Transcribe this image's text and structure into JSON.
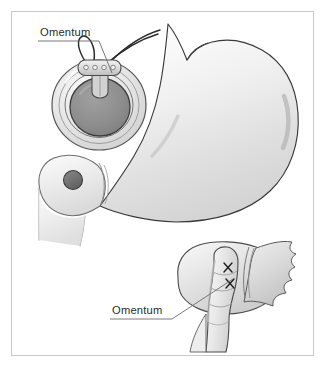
{
  "figure": {
    "background_color": "#ffffff",
    "border_color": "#c9c9c9",
    "ink_color": "#2b2b2b"
  },
  "labels": [
    {
      "id": "omentum-top",
      "text": "Omentum",
      "x": 40,
      "y": 36,
      "underline": {
        "x1": 38,
        "y1": 41,
        "x2": 99,
        "y2": 41
      },
      "leader": {
        "x1": 99,
        "y1": 41,
        "x2": 112,
        "y2": 73
      }
    },
    {
      "id": "omentum-bottom",
      "text": "Omentum",
      "x": 112,
      "y": 314,
      "underline": {
        "x1": 110,
        "y1": 319,
        "x2": 172,
        "y2": 319
      },
      "leader": {
        "x1": 172,
        "y1": 319,
        "x2": 232,
        "y2": 280
      }
    }
  ],
  "anatomy": {
    "stomach": {
      "name": "stomach-body",
      "fill_top": "#fdfdfd",
      "fill_bottom": "#d6d6d6",
      "outline": "#3a3a3a"
    },
    "duodenum": {
      "name": "duodenal-limb",
      "fill_top": "#fbfbfb",
      "fill_bottom": "#dcdcdc",
      "outline": "#6e6e6e"
    },
    "port_site": {
      "name": "access-port",
      "fill": "#6f6f6f",
      "outline": "#3c3c3c",
      "cx": 73,
      "cy": 180,
      "r": 9
    }
  },
  "device": {
    "band": {
      "name": "gastric-band-ring",
      "cx": 99,
      "cy": 105,
      "outer_rx": 47,
      "outer_ry": 45,
      "ring_fill": "#e8e8e8",
      "ring_outline": "#55555a",
      "lumen_fill": "#8e8e8e",
      "lumen_outline": "#3d3d3d",
      "lumen_rx": 30,
      "lumen_ry": 29
    },
    "buckle": {
      "name": "band-buckle",
      "cx": 99,
      "cy": 68,
      "width": 40,
      "height": 15,
      "fill": "#dcdcdc",
      "outline": "#4a4a4a",
      "stud_count": 4
    },
    "tubing": {
      "name": "band-tubing",
      "color": "#2b2b2b",
      "line_count": 2
    },
    "omental_loop": {
      "name": "omental-suture-loop",
      "color": "#2b2b2b"
    }
  },
  "inset": {
    "name": "omental-wrap-inset",
    "tissue_fill_light": "#f4f4f4",
    "tissue_fill_mid": "#d8d8d8",
    "tissue_fill_dark": "#bfbfbf",
    "outline": "#4a4a4a",
    "sutures": [
      {
        "name": "suture-x-upper",
        "x": 228,
        "y": 268,
        "size": 5
      },
      {
        "name": "suture-x-lower",
        "x": 231,
        "y": 283,
        "size": 5
      }
    ],
    "suture_color": "#1f1f1f"
  }
}
